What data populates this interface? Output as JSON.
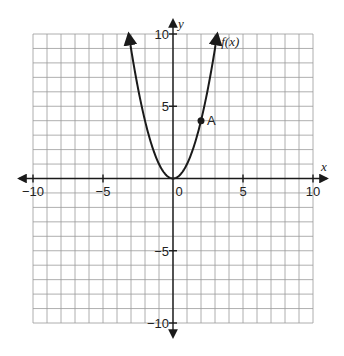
{
  "chart_data": {
    "type": "line",
    "title": "",
    "xlabel": "x",
    "ylabel": "y",
    "xlim": [
      -10,
      10
    ],
    "ylim": [
      -10,
      10
    ],
    "grid": true,
    "grid_step": 1,
    "x_ticks": [
      {
        "value": -10,
        "label": "−10"
      },
      {
        "value": -5,
        "label": "−5"
      },
      {
        "value": 0,
        "label": "0"
      },
      {
        "value": 5,
        "label": "5"
      },
      {
        "value": 10,
        "label": "10"
      }
    ],
    "y_ticks": [
      {
        "value": 10,
        "label": "10"
      },
      {
        "value": 5,
        "label": "5"
      },
      {
        "value": -5,
        "label": "−5"
      },
      {
        "value": -10,
        "label": "−10"
      }
    ],
    "series": [
      {
        "name": "f(x)",
        "label": "f(x)",
        "formula": "x^2",
        "x": [
          -3.16,
          -3,
          -2.5,
          -2,
          -1.5,
          -1,
          -0.5,
          0,
          0.5,
          1,
          1.5,
          2,
          2.5,
          3,
          3.16
        ],
        "y": [
          10,
          9,
          6.25,
          4,
          2.25,
          1,
          0.25,
          0,
          0.25,
          1,
          2.25,
          4,
          6.25,
          9,
          10
        ],
        "arrows_at_ends": true
      }
    ],
    "annotations": [
      {
        "type": "point",
        "label": "A",
        "x": 2,
        "y": 4
      }
    ]
  }
}
